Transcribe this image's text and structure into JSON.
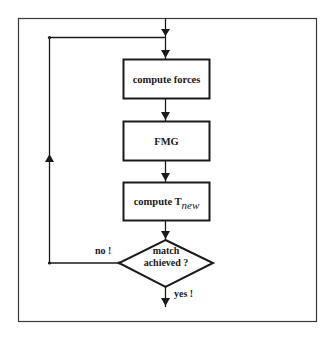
{
  "diagram": {
    "type": "flowchart",
    "colors": {
      "stroke": "#1a1a1a",
      "frame": "#3a3a3a",
      "background": "#ffffff"
    },
    "nodes": [
      {
        "id": "compute_forces",
        "shape": "rectangle",
        "label": "compute forces"
      },
      {
        "id": "fmg",
        "shape": "rectangle",
        "label": "FMG"
      },
      {
        "id": "compute_tnew",
        "shape": "rectangle",
        "label_main": "compute T",
        "label_sub": "new"
      },
      {
        "id": "decision",
        "shape": "diamond",
        "label_line1": "match",
        "label_line2": "achieved ?"
      }
    ],
    "edges": [
      {
        "from": "entry",
        "to": "compute_forces"
      },
      {
        "from": "compute_forces",
        "to": "fmg"
      },
      {
        "from": "fmg",
        "to": "compute_tnew"
      },
      {
        "from": "compute_tnew",
        "to": "decision"
      },
      {
        "from": "decision",
        "to": "compute_forces",
        "label": "no !"
      },
      {
        "from": "decision",
        "to": "exit",
        "label": "yes !"
      }
    ],
    "edge_labels": {
      "no": "no !",
      "yes": "yes !"
    }
  }
}
